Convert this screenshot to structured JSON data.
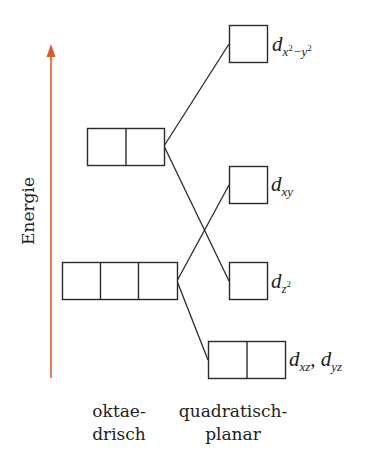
{
  "axis": {
    "label": "Energie",
    "arrow_color": "#e0592a"
  },
  "groups": {
    "octahedral": {
      "line1": "oktae-",
      "line2": "drisch"
    },
    "square_planar": {
      "line1": "quadratisch-",
      "line2": "planar"
    }
  },
  "levels": {
    "octahedral_upper": {
      "name": "e_g",
      "orbital_count": 2
    },
    "octahedral_lower": {
      "name": "t_2g",
      "orbital_count": 3
    },
    "square_planar": [
      {
        "id": "dx2y2",
        "orbital_count": 1,
        "label_main": "d",
        "label_sub": "x",
        "label_sup1": "2",
        "label_sub_mid": "−y",
        "label_sup2": "2"
      },
      {
        "id": "dxy",
        "orbital_count": 1,
        "label_main": "d",
        "label_sub": "xy"
      },
      {
        "id": "dz2",
        "orbital_count": 1,
        "label_main": "d",
        "label_sub": "z",
        "label_sup": "2"
      },
      {
        "id": "dxz_dyz",
        "orbital_count": 2,
        "label_main": "d",
        "label_sub": "xz",
        "label_sep": ", ",
        "label_main2": "d",
        "label_sub2": "yz"
      }
    ]
  }
}
